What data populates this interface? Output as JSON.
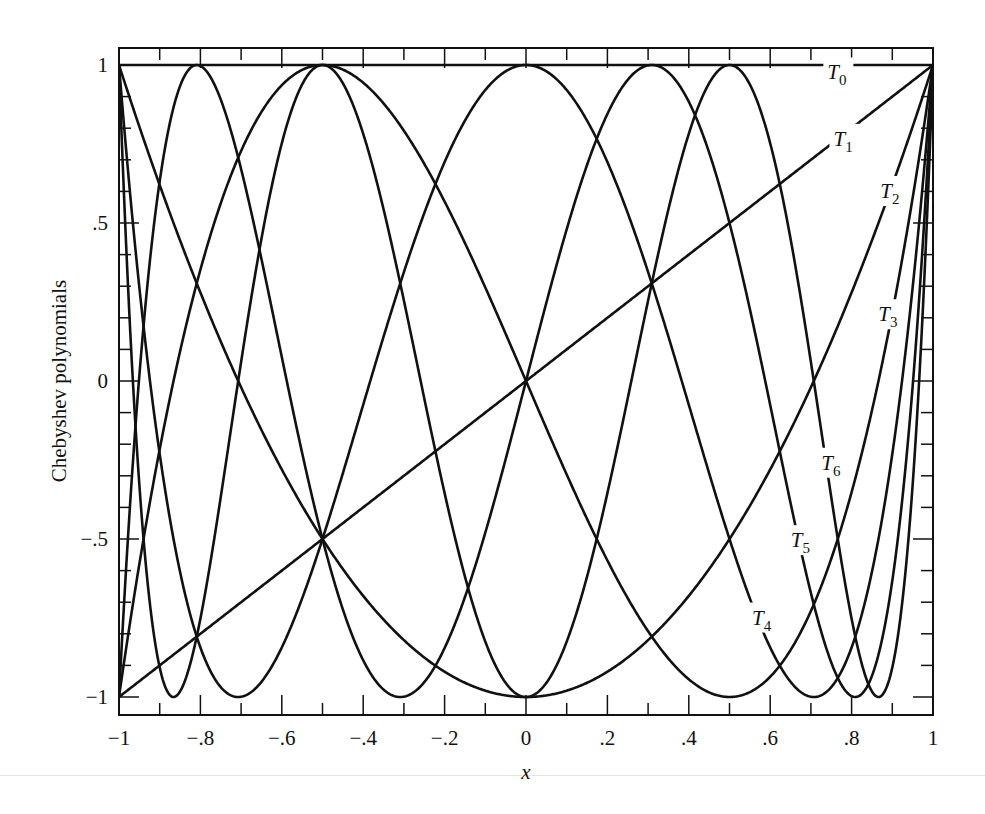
{
  "chart_data": {
    "type": "line",
    "title": "",
    "xlabel": "x",
    "ylabel": "Chebyshev polynomials",
    "xlim": [
      -1,
      1
    ],
    "ylim": [
      -1.05,
      1.05
    ],
    "grid": false,
    "legend": "inline curve labels",
    "x_ticks": [
      -1,
      -0.8,
      -0.6,
      -0.4,
      -0.2,
      0,
      0.2,
      0.4,
      0.6,
      0.8,
      1
    ],
    "x_tick_labels": [
      "−1",
      "−.8",
      "−.6",
      "−.4",
      "−.2",
      "0",
      ".2",
      ".4",
      ".6",
      ".8",
      "1"
    ],
    "y_ticks": [
      1,
      0.5,
      0,
      -0.5,
      -1
    ],
    "y_tick_labels": [
      "1",
      ".5",
      "0",
      "−.5",
      "−1"
    ],
    "x_minor_step": 0.1,
    "y_minor_step": 0.1,
    "series": [
      {
        "name": "T0",
        "degree": 0,
        "formula": "T0(x) = 1",
        "label_x": 0.765,
        "label_y": 0.97
      },
      {
        "name": "T1",
        "degree": 1,
        "formula": "T1(x) = x",
        "label_x": 0.78,
        "label_y": 0.76
      },
      {
        "name": "T2",
        "degree": 2,
        "formula": "T2(x) = 2x^2 - 1",
        "label_x": 0.895,
        "label_y": 0.595
      },
      {
        "name": "T3",
        "degree": 3,
        "formula": "T3(x) = 4x^3 - 3x",
        "label_x": 0.89,
        "label_y": 0.205
      },
      {
        "name": "T4",
        "degree": 4,
        "formula": "T4(x) = 8x^4 - 8x^2 + 1",
        "label_x": 0.58,
        "label_y": -0.755
      },
      {
        "name": "T5",
        "degree": 5,
        "formula": "T5(x) = 16x^5 - 20x^3 + 5x",
        "label_x": 0.675,
        "label_y": -0.51
      },
      {
        "name": "T6",
        "degree": 6,
        "formula": "T6(x) = 32x^6 - 48x^4 + 18x^2 - 1",
        "label_x": 0.75,
        "label_y": -0.265
      }
    ],
    "sample_points": {
      "x": [
        -1,
        -0.8,
        -0.6,
        -0.4,
        -0.2,
        0,
        0.2,
        0.4,
        0.6,
        0.8,
        1
      ],
      "T0": [
        1,
        1,
        1,
        1,
        1,
        1,
        1,
        1,
        1,
        1,
        1
      ],
      "T1": [
        -1,
        -0.8,
        -0.6,
        -0.4,
        -0.2,
        0,
        0.2,
        0.4,
        0.6,
        0.8,
        1
      ],
      "T2": [
        1,
        0.28,
        -0.28,
        -0.68,
        -0.92,
        -1,
        -0.92,
        -0.68,
        -0.28,
        0.28,
        1
      ],
      "T3": [
        -1,
        0.352,
        0.936,
        0.944,
        0.568,
        0,
        -0.568,
        -0.944,
        -0.936,
        -0.352,
        1
      ],
      "T4": [
        1,
        -0.8432,
        -0.8432,
        0.0752,
        0.6928,
        1,
        0.6928,
        0.0752,
        -0.8432,
        -0.8432,
        1
      ],
      "T5": [
        -1,
        -0.9971,
        0.0758,
        0.9997,
        0.3808,
        0,
        -0.3808,
        -0.9997,
        -0.0758,
        0.9971,
        1
      ],
      "T6": [
        1,
        -0.7521,
        0.9352,
        -0.475,
        0.1597,
        -1,
        0.1597,
        -0.475,
        0.9352,
        -0.7521,
        1
      ]
    }
  }
}
